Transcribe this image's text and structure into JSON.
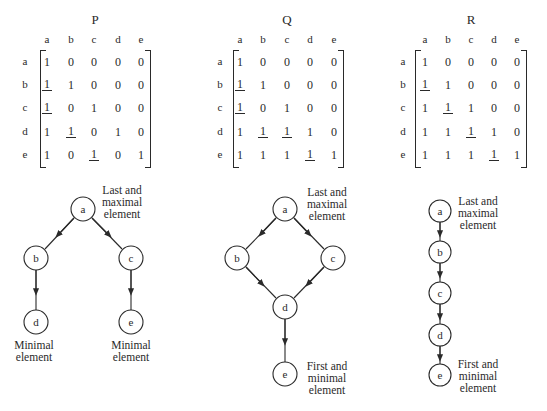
{
  "matrices": [
    {
      "id": "P",
      "title": "P",
      "col_labels": [
        "a",
        "b",
        "c",
        "d",
        "e"
      ],
      "row_labels": [
        "a",
        "b",
        "c",
        "d",
        "e"
      ],
      "rows": [
        [
          "1",
          "0",
          "0",
          "0",
          "0"
        ],
        [
          "1",
          "1",
          "0",
          "0",
          "0"
        ],
        [
          "1",
          "0",
          "1",
          "0",
          "0"
        ],
        [
          "1",
          "1",
          "0",
          "1",
          "0"
        ],
        [
          "1",
          "0",
          "1",
          "0",
          "1"
        ]
      ],
      "underlined": [
        [
          1,
          0
        ],
        [
          2,
          0
        ],
        [
          3,
          1
        ],
        [
          4,
          2
        ]
      ]
    },
    {
      "id": "Q",
      "title": "Q",
      "col_labels": [
        "a",
        "b",
        "c",
        "d",
        "e"
      ],
      "row_labels": [
        "a",
        "b",
        "c",
        "d",
        "e"
      ],
      "rows": [
        [
          "1",
          "0",
          "0",
          "0",
          "0"
        ],
        [
          "1",
          "1",
          "0",
          "0",
          "0"
        ],
        [
          "1",
          "0",
          "1",
          "0",
          "0"
        ],
        [
          "1",
          "1",
          "1",
          "1",
          "0"
        ],
        [
          "1",
          "1",
          "1",
          "1",
          "1"
        ]
      ],
      "underlined": [
        [
          1,
          0
        ],
        [
          2,
          0
        ],
        [
          3,
          1
        ],
        [
          3,
          2
        ],
        [
          4,
          3
        ]
      ]
    },
    {
      "id": "R",
      "title": "R",
      "col_labels": [
        "a",
        "b",
        "c",
        "d",
        "e"
      ],
      "row_labels": [
        "a",
        "b",
        "c",
        "d",
        "e"
      ],
      "rows": [
        [
          "1",
          "0",
          "0",
          "0",
          "0"
        ],
        [
          "1",
          "1",
          "0",
          "0",
          "0"
        ],
        [
          "1",
          "1",
          "1",
          "0",
          "0"
        ],
        [
          "1",
          "1",
          "1",
          "1",
          "0"
        ],
        [
          "1",
          "1",
          "1",
          "1",
          "1"
        ]
      ],
      "underlined": [
        [
          1,
          0
        ],
        [
          2,
          1
        ],
        [
          3,
          2
        ],
        [
          4,
          3
        ]
      ]
    }
  ],
  "diagrams": {
    "P": {
      "nodes": [
        "a",
        "b",
        "c",
        "d",
        "e"
      ],
      "edges": [
        [
          "a",
          "b"
        ],
        [
          "a",
          "c"
        ],
        [
          "b",
          "d"
        ],
        [
          "c",
          "e"
        ]
      ],
      "labels": {
        "top": [
          "Last and",
          "maximal",
          "element"
        ],
        "min_left": [
          "Minimal",
          "element"
        ],
        "min_right": [
          "Minimal",
          "element"
        ]
      }
    },
    "Q": {
      "nodes": [
        "a",
        "b",
        "c",
        "d",
        "e"
      ],
      "edges": [
        [
          "a",
          "b"
        ],
        [
          "a",
          "c"
        ],
        [
          "b",
          "d"
        ],
        [
          "c",
          "d"
        ],
        [
          "d",
          "e"
        ]
      ],
      "labels": {
        "top": [
          "Last and",
          "maximal",
          "element"
        ],
        "bottom": [
          "First and",
          "minimal",
          "element"
        ]
      }
    },
    "R": {
      "nodes": [
        "a",
        "b",
        "c",
        "d",
        "e"
      ],
      "edges": [
        [
          "a",
          "b"
        ],
        [
          "b",
          "c"
        ],
        [
          "c",
          "d"
        ],
        [
          "d",
          "e"
        ]
      ],
      "labels": {
        "top": [
          "Last and",
          "maximal",
          "element"
        ],
        "bottom": [
          "First and",
          "minimal",
          "element"
        ]
      }
    }
  }
}
